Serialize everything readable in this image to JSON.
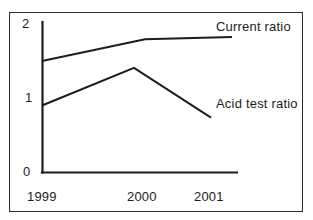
{
  "figure": {
    "background_color": "#ffffff",
    "ink_color": "#1d1d1d",
    "frame_color": "#2b2b2b"
  },
  "chart_data": {
    "type": "line",
    "title": "",
    "subtitle": "",
    "xlabel": "",
    "ylabel": "",
    "categories": [
      "1999",
      "2000",
      "2001"
    ],
    "x_tick_labels": [
      "1999",
      "2000",
      "2001"
    ],
    "y_tick_labels": [
      "0",
      "1",
      "2"
    ],
    "ylim": [
      0,
      2
    ],
    "xlim": [
      "1999",
      "2001"
    ],
    "grid": false,
    "legend_position": "right-inline",
    "series": [
      {
        "name": "Current ratio",
        "label": "Current ratio",
        "color": "#1d1d1d",
        "values": [
          1.48,
          1.77,
          1.8
        ]
      },
      {
        "name": "Acid test ratio",
        "label": "Acid test ratio",
        "color": "#1d1d1d",
        "values": [
          0.89,
          1.39,
          0.73
        ]
      }
    ],
    "annotations": [
      "Current ratio",
      "Acid test ratio"
    ]
  },
  "axes": {
    "y_ticks": [
      {
        "label": "2",
        "value": 2
      },
      {
        "label": "1",
        "value": 1
      },
      {
        "label": "0",
        "value": 0
      }
    ],
    "x_ticks": [
      {
        "label": "1999"
      },
      {
        "label": "2000"
      },
      {
        "label": "2001"
      }
    ]
  },
  "legend": {
    "current_ratio": "Current ratio",
    "acid_test_ratio": "Acid test ratio"
  }
}
